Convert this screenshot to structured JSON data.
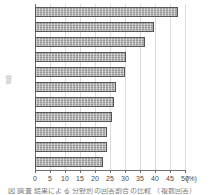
{
  "chart_data": {
    "type": "bar",
    "orientation": "horizontal",
    "title": "",
    "xlabel": "(%)",
    "ylabel": "項目",
    "xlim": [
      0,
      50
    ],
    "xticks": [
      0,
      5,
      10,
      15,
      20,
      25,
      30,
      35,
      40,
      45,
      50
    ],
    "xtick_labels": [
      "0",
      "5",
      "10",
      "15",
      "20",
      "25",
      "30",
      "35",
      "40",
      "45",
      "50"
    ],
    "unit": "(%)",
    "grid": true,
    "grid_axis": "x",
    "legend": false,
    "categories": [
      "",
      "",
      "",
      "",
      "",
      "",
      "",
      "",
      "",
      "",
      ""
    ],
    "values": [
      47.7,
      39.8,
      36.6,
      30.4,
      30.0,
      27.0,
      26.2,
      25.6,
      24.0,
      24.0,
      22.6
    ],
    "bar_count": 11,
    "bar_fill": "#a9a9a9",
    "bar_edge": "#555555",
    "grid_color": "#dcdcdc",
    "axis_color": "#6e6e6e"
  },
  "caption": {
    "cropped_text": "図  調査  結果による  分野別の回答割合の比較 （複数回答）"
  }
}
